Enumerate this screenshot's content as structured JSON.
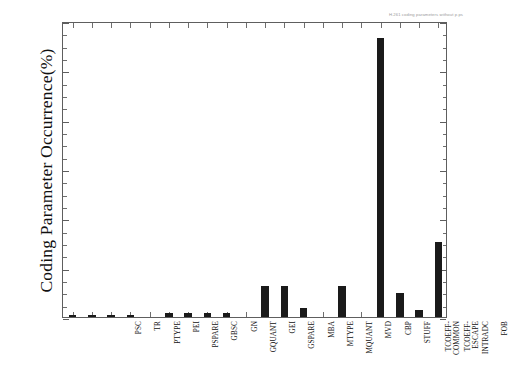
{
  "figure": {
    "header_annotation": "H.261 coding parameters without p.ps",
    "background_color": "#ffffff",
    "bar_color": "#1a1a1a",
    "axis_color": "#5e5e5e"
  },
  "chart_data": {
    "type": "bar",
    "title": "",
    "xlabel": "",
    "ylabel": "Coding Parameter Occurrence(%)",
    "ylim": [
      0,
      60
    ],
    "ytick_labels": [
      "0",
      "10",
      "20",
      "30",
      "40",
      "50",
      "60"
    ],
    "ytick_values": [
      0,
      10,
      20,
      30,
      40,
      50,
      60
    ],
    "yminor_step": 2.5,
    "grid": false,
    "legend": "none",
    "categories": [
      "PSC",
      "TR",
      "PTYPE",
      "PEI",
      "PSPARE",
      "GBSC",
      "GN",
      "GQUANT",
      "GEI",
      "GSPARE",
      "MBA",
      "MTYPE",
      "MQUANT",
      "MVD",
      "CBP",
      "STUFF",
      "TCOEFF-\nCOMMON",
      "TCOEFF-\nESCAPE",
      "INTRADC",
      "FOB"
    ],
    "values": [
      0.5,
      0.5,
      0.5,
      0.5,
      0.0,
      0.9,
      0.9,
      0.9,
      0.9,
      0.0,
      6.3,
      6.3,
      1.8,
      0.0,
      6.3,
      0.0,
      56.5,
      4.8,
      1.5,
      15.2
    ]
  }
}
